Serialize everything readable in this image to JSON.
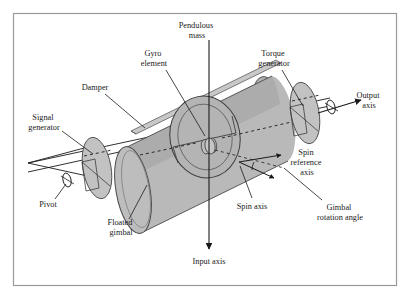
{
  "figure": {
    "type": "technical-line-diagram",
    "border_color": "#9a9a9a",
    "background_color": "#ffffff",
    "ink_color": "#1a1a1a",
    "body_fill": "#b9b9b9",
    "body_top_fill": "#a8a8a8",
    "face_fill": "#bdbdbd",
    "disc_fill": "#c2c2c2",
    "labels": [
      {
        "id": "pendulous-mass",
        "text_lines": [
          "Pendulous",
          "mass"
        ],
        "x": 197,
        "y": 30
      },
      {
        "id": "gyro-element",
        "text_lines": [
          "Gyro",
          "element"
        ],
        "x": 154,
        "y": 58
      },
      {
        "id": "torque-generator",
        "text_lines": [
          "Torque",
          "generator"
        ],
        "x": 274,
        "y": 58
      },
      {
        "id": "damper",
        "text_lines": [
          "Damper"
        ],
        "x": 95,
        "y": 88
      },
      {
        "id": "signal-generator",
        "text_lines": [
          "Signal",
          "generator"
        ],
        "x": 44,
        "y": 123
      },
      {
        "id": "output-axis",
        "text_lines": [
          "Output",
          "axis"
        ],
        "x": 369,
        "y": 100
      },
      {
        "id": "spin-reference-axis",
        "text_lines": [
          "Spin",
          "reference",
          "axis"
        ],
        "x": 307,
        "y": 163
      },
      {
        "id": "spin-axis",
        "text_lines": [
          "Spin axis"
        ],
        "x": 252,
        "y": 207
      },
      {
        "id": "gimbal-rotation-angle",
        "text_lines": [
          "Gimbal",
          "rotation angle"
        ],
        "x": 340,
        "y": 213
      },
      {
        "id": "pivot",
        "text_lines": [
          "Pivot"
        ],
        "x": 48,
        "y": 205
      },
      {
        "id": "floated-gimbal",
        "text_lines": [
          "Floated",
          "gimbal"
        ],
        "x": 121,
        "y": 228
      },
      {
        "id": "input-axis",
        "text_lines": [
          "Input axis"
        ],
        "x": 209,
        "y": 262
      }
    ]
  }
}
